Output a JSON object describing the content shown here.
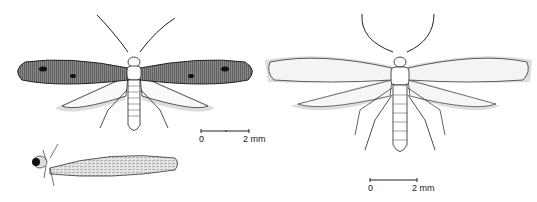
{
  "figure": {
    "subjects": [
      {
        "id": "moth-left",
        "description": "adult moth, dark speckled forewings with black spots"
      },
      {
        "id": "larva",
        "description": "larva in case"
      },
      {
        "id": "moth-right",
        "description": "adult moth, pale forewings"
      }
    ],
    "scale_bars": [
      {
        "id": "scale-left",
        "start_label": "0",
        "end_label": "2 mm"
      },
      {
        "id": "scale-right",
        "start_label": "0",
        "end_label": "2 mm"
      }
    ],
    "colors": {
      "ink": "#1a1a1a",
      "dark_wing": "#4a4a4a",
      "pale_wing": "#f2f2f2",
      "background": "#ffffff"
    }
  }
}
